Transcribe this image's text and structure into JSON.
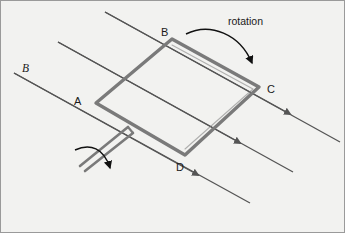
{
  "figure": {
    "name": "rotating-coil-in-magnetic-field",
    "background_color": "#f2f2f0",
    "border_color": "#9a9a9a",
    "width": 345,
    "height": 233
  },
  "field": {
    "label": "B",
    "label_style": "italic",
    "line_color": "#555555",
    "line_count": 3,
    "direction": "down-right",
    "arrow_marker": "triangle-midline"
  },
  "coil": {
    "color": "#7a7a7a",
    "stroke_width": 3.4,
    "shape": "rounded-rhombus-loop",
    "vertices": [
      {
        "label": "B",
        "position": "top"
      },
      {
        "label": "C",
        "position": "right"
      },
      {
        "label": "D",
        "position": "bottom"
      },
      {
        "label": "A",
        "position": "left"
      }
    ]
  },
  "leads": {
    "name": "lead-wires",
    "count": 2,
    "color": "#7a7a7a",
    "direction": "down-left"
  },
  "annotations": {
    "rotation_label": "rotation",
    "rotation_arrow_color": "#111111",
    "axis_rotation_arrow_color": "#111111"
  },
  "labels": {
    "a": "A",
    "b_corner": "B",
    "c": "C",
    "d": "D",
    "b_field": "B",
    "rotation": "rotation"
  }
}
